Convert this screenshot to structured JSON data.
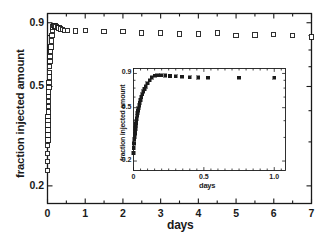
{
  "figure": {
    "background": "#ffffff",
    "frame_color": "#1a1a1a",
    "marker_color": "#1a1a1a"
  },
  "main": {
    "xlabel": "days",
    "ylabel": "fraction injected amount",
    "x_tick_labels": [
      "0",
      "1",
      "2",
      "3",
      "4",
      "5",
      "6",
      "7"
    ],
    "y_tick_labels": [
      "0.9",
      "0.5",
      "0.2"
    ]
  },
  "inset": {
    "xlabel": "days",
    "ylabel": "fraction injected amount",
    "x_tick_labels": [
      "0",
      "0.5",
      "1.0"
    ],
    "y_tick_labels": [
      "0.9",
      "0.5",
      "0.2"
    ]
  },
  "chart_data": [
    {
      "id": "main-plot",
      "type": "scatter",
      "title": "",
      "xlabel": "days",
      "ylabel": "fraction injected amount",
      "xlim": [
        0,
        7
      ],
      "ylim": [
        0.17,
        0.98
      ],
      "yscale": "log",
      "xscale": "linear",
      "grid": false,
      "legend": null,
      "marker": "open-square",
      "xticks": [
        0,
        1,
        2,
        3,
        4,
        5,
        6,
        7
      ],
      "xtick_labels": [
        "0",
        "1",
        "2",
        "3",
        "4",
        "5",
        "6",
        "7"
      ],
      "xminor_step": 0.5,
      "yticks": [
        0.9,
        0.5,
        0.2
      ],
      "ytick_labels": [
        "0.9",
        "0.5",
        "0.2"
      ],
      "series": [
        {
          "name": "fraction injected amount",
          "x": [
            0.0,
            0.002,
            0.004,
            0.006,
            0.008,
            0.01,
            0.012,
            0.014,
            0.016,
            0.018,
            0.02,
            0.023,
            0.026,
            0.029,
            0.032,
            0.036,
            0.04,
            0.045,
            0.05,
            0.056,
            0.062,
            0.07,
            0.078,
            0.088,
            0.1,
            0.115,
            0.13,
            0.15,
            0.17,
            0.195,
            0.225,
            0.26,
            0.3,
            0.345,
            0.4,
            0.46,
            0.53,
            0.75,
            1.0,
            1.5,
            2.0,
            2.5,
            3.0,
            3.5,
            4.0,
            4.5,
            5.0,
            5.5,
            6.0,
            6.5,
            7.0
          ],
          "y": [
            0.23,
            0.25,
            0.27,
            0.29,
            0.305,
            0.32,
            0.335,
            0.35,
            0.365,
            0.38,
            0.395,
            0.415,
            0.435,
            0.455,
            0.475,
            0.495,
            0.52,
            0.545,
            0.57,
            0.6,
            0.63,
            0.66,
            0.69,
            0.72,
            0.76,
            0.8,
            0.84,
            0.865,
            0.875,
            0.872,
            0.868,
            0.862,
            0.856,
            0.85,
            0.845,
            0.84,
            0.838,
            0.835,
            0.838,
            0.832,
            0.832,
            0.82,
            0.818,
            0.812,
            0.81,
            0.818,
            0.802,
            0.805,
            0.808,
            0.8,
            0.79
          ]
        }
      ]
    },
    {
      "id": "inset-plot",
      "type": "scatter",
      "title": "",
      "xlabel": "days",
      "ylabel": "fraction injected amount",
      "xlim": [
        0,
        1.08
      ],
      "ylim": [
        0.17,
        0.98
      ],
      "yscale": "log",
      "xscale": "linear",
      "grid": false,
      "legend": null,
      "marker": "filled-square",
      "xticks": [
        0,
        0.5,
        1.0
      ],
      "xtick_labels": [
        "0",
        "0.5",
        "1.0"
      ],
      "xminor_step": 0.05,
      "yticks": [
        0.9,
        0.5,
        0.2
      ],
      "ytick_labels": [
        "0.9",
        "0.5",
        "0.2"
      ],
      "series": [
        {
          "name": "fraction injected amount",
          "x": [
            0.0,
            0.002,
            0.004,
            0.006,
            0.008,
            0.01,
            0.012,
            0.014,
            0.016,
            0.018,
            0.02,
            0.023,
            0.026,
            0.029,
            0.032,
            0.036,
            0.04,
            0.045,
            0.05,
            0.056,
            0.062,
            0.07,
            0.078,
            0.088,
            0.1,
            0.115,
            0.13,
            0.15,
            0.17,
            0.195,
            0.225,
            0.26,
            0.3,
            0.345,
            0.4,
            0.46,
            0.53,
            0.75,
            1.0
          ],
          "y": [
            0.23,
            0.25,
            0.27,
            0.29,
            0.305,
            0.32,
            0.335,
            0.35,
            0.365,
            0.38,
            0.395,
            0.415,
            0.435,
            0.455,
            0.475,
            0.495,
            0.52,
            0.545,
            0.57,
            0.6,
            0.63,
            0.66,
            0.69,
            0.72,
            0.76,
            0.8,
            0.84,
            0.865,
            0.875,
            0.872,
            0.868,
            0.862,
            0.856,
            0.85,
            0.845,
            0.84,
            0.838,
            0.835,
            0.838
          ]
        }
      ]
    }
  ]
}
